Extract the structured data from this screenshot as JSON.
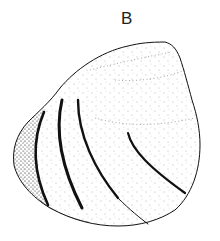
{
  "figure": {
    "panel_label": "B",
    "colors": {
      "background": "#ffffff",
      "ink": "#111111"
    }
  }
}
